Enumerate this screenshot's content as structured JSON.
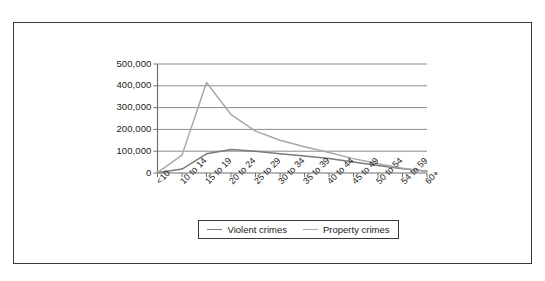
{
  "figure": {
    "frame_border_color": "#3a3a3a",
    "background_color": "#ffffff"
  },
  "chart_data": {
    "type": "line",
    "title": "",
    "subtitle": "",
    "xlabel": "",
    "ylabel": "",
    "categories": [
      "<10",
      "10 to 14",
      "15 to 19",
      "20 to 24",
      "25 to 29",
      "30 to 34",
      "35 to 39",
      "40 to 44",
      "45 to 49",
      "50 to 54",
      "54 to 59",
      "60+"
    ],
    "series": [
      {
        "name": "Violent crimes",
        "color": "#7a7a7a",
        "values": [
          1000,
          18000,
          88000,
          108000,
          100000,
          88000,
          78000,
          66000,
          50000,
          34000,
          20000,
          8000
        ]
      },
      {
        "name": "Property crimes",
        "color": "#a8a8a8",
        "values": [
          2000,
          82000,
          415000,
          268000,
          192000,
          150000,
          120000,
          94000,
          66000,
          42000,
          22000,
          8000
        ]
      }
    ],
    "ylim": [
      0,
      500000
    ],
    "yticks": [
      0,
      100000,
      200000,
      300000,
      400000,
      500000
    ],
    "ytick_labels": [
      "0",
      "100,000",
      "200,000",
      "300,000",
      "400,000",
      "500,000"
    ],
    "grid": "horizontal",
    "legend_position": "below-center",
    "xtick_label_rotation": -45
  },
  "legend": {
    "entries": [
      {
        "label": "Violent crimes",
        "color": "#7a7a7a"
      },
      {
        "label": "Property crimes",
        "color": "#a8a8a8"
      }
    ]
  }
}
